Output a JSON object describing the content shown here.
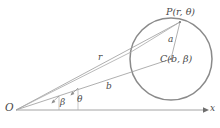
{
  "figure": {
    "width": 220,
    "height": 128,
    "background": "#ffffff",
    "stroke_circle": "#8a8a8a",
    "stroke_line": "#9a9a9a",
    "stroke_axis": "#9a9a9a",
    "text_color": "#4a4a4a"
  },
  "labels": {
    "point_P": "P(r, θ)",
    "center_C": "C(b, β)",
    "radius_a": "a",
    "radius_r": "r",
    "distance_b": "b",
    "angle_beta": "β",
    "angle_theta": "θ",
    "origin_O": "O",
    "axis_x": "x"
  },
  "geometry": {
    "origin": {
      "x": 16,
      "y": 110
    },
    "circle": {
      "cx": 171,
      "cy": 59,
      "r": 41
    },
    "point_P": {
      "x": 180,
      "y": 22
    },
    "axis_end": {
      "x": 204,
      "y": 110
    },
    "angle_beta_tick_x": 59,
    "angle_theta_tick_x": 78
  }
}
